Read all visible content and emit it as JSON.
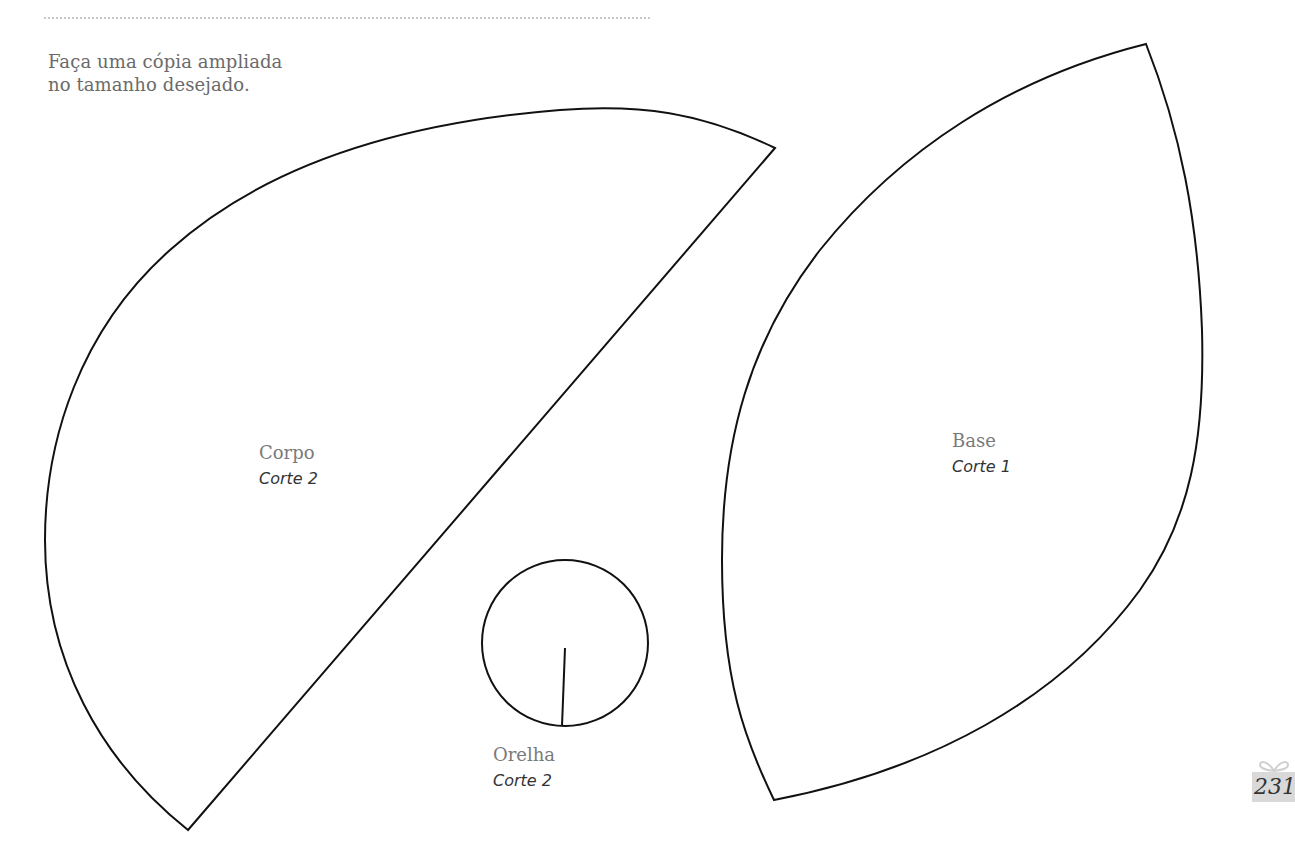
{
  "page": {
    "intro_lines": [
      "Faça uma cópia ampliada",
      "no tamanho desejado."
    ],
    "page_number": "231"
  },
  "pieces": [
    {
      "name": "Corpo",
      "cut": "Corte 2"
    },
    {
      "name": "Orelha",
      "cut": "Corte 2"
    },
    {
      "name": "Base",
      "cut": "Corte 1"
    }
  ],
  "colors": {
    "outline": "#111111",
    "intro_text": "#6a6a6a",
    "badge_bg": "#d9d9d9"
  }
}
